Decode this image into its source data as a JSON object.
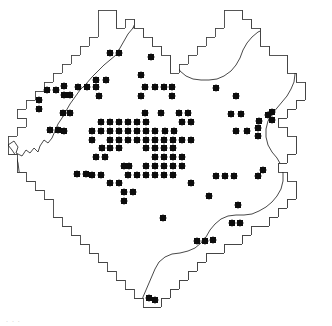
{
  "figure": {
    "kind": "distribution-map",
    "title": "",
    "caption": "",
    "faint_caption_artifact": ". . .",
    "width_px": 332,
    "height_px": 326
  },
  "colors": {
    "background": "#ffffff",
    "region_fill": "#ffffff",
    "region_outline": "#444444",
    "grid_minor": "#3a3a3a",
    "grid_major": "#111111",
    "river": "#1a1a1a",
    "dot": "#0d0d0d"
  },
  "grid": {
    "cell_px": 9,
    "minor_line_width": 0.65,
    "major_line_width": 1.7,
    "major_every_cells": 5,
    "origin_x": 8,
    "origin_y": 1,
    "cols": 36,
    "rows": 36,
    "major_x": [
      35,
      80,
      125,
      170,
      215,
      260,
      305
    ],
    "major_y": [
      28,
      73,
      118,
      163,
      208,
      253,
      298
    ]
  },
  "chart_data": {
    "type": "scatter",
    "xlabel": "",
    "ylabel": "",
    "symbol": "filled-circle",
    "symbol_radius_px": 3.4,
    "record_count": 122,
    "legend": [],
    "records": [
      [
        110,
        53
      ],
      [
        119,
        53
      ],
      [
        151,
        57
      ],
      [
        141,
        75
      ],
      [
        96,
        80
      ],
      [
        106,
        80
      ],
      [
        64,
        86
      ],
      [
        78,
        87
      ],
      [
        87,
        87
      ],
      [
        96,
        87
      ],
      [
        47,
        90
      ],
      [
        56,
        90
      ],
      [
        145,
        87
      ],
      [
        155,
        87
      ],
      [
        164,
        87
      ],
      [
        172,
        87
      ],
      [
        141,
        96
      ],
      [
        172,
        96
      ],
      [
        39,
        100
      ],
      [
        39,
        109
      ],
      [
        99,
        96
      ],
      [
        64,
        95
      ],
      [
        70,
        95
      ],
      [
        216,
        88
      ],
      [
        236,
        96
      ],
      [
        231,
        114
      ],
      [
        145,
        113
      ],
      [
        161,
        113
      ],
      [
        63,
        113
      ],
      [
        70,
        113
      ],
      [
        179,
        113
      ],
      [
        188,
        113
      ],
      [
        241,
        114
      ],
      [
        268,
        115
      ],
      [
        272,
        112
      ],
      [
        272,
        120
      ],
      [
        259,
        121
      ],
      [
        101,
        122
      ],
      [
        128,
        122
      ],
      [
        137,
        122
      ],
      [
        146,
        122
      ],
      [
        119,
        122
      ],
      [
        110,
        122
      ],
      [
        182,
        122
      ],
      [
        191,
        122
      ],
      [
        50,
        130
      ],
      [
        58,
        130
      ],
      [
        64,
        131
      ],
      [
        92,
        131
      ],
      [
        101,
        131
      ],
      [
        128,
        131
      ],
      [
        137,
        131
      ],
      [
        146,
        131
      ],
      [
        155,
        131
      ],
      [
        119,
        131
      ],
      [
        110,
        131
      ],
      [
        165,
        131
      ],
      [
        174,
        131
      ],
      [
        236,
        131
      ],
      [
        247,
        131
      ],
      [
        258,
        128
      ],
      [
        258,
        136
      ],
      [
        92,
        140
      ],
      [
        128,
        140
      ],
      [
        137,
        140
      ],
      [
        146,
        140
      ],
      [
        155,
        140
      ],
      [
        164,
        140
      ],
      [
        173,
        140
      ],
      [
        182,
        140
      ],
      [
        191,
        140
      ],
      [
        110,
        140
      ],
      [
        119,
        140
      ],
      [
        102,
        148
      ],
      [
        110,
        148
      ],
      [
        119,
        148
      ],
      [
        146,
        148
      ],
      [
        155,
        148
      ],
      [
        164,
        148
      ],
      [
        173,
        148
      ],
      [
        96,
        157
      ],
      [
        105,
        157
      ],
      [
        155,
        157
      ],
      [
        164,
        157
      ],
      [
        173,
        157
      ],
      [
        182,
        157
      ],
      [
        146,
        166
      ],
      [
        155,
        166
      ],
      [
        164,
        166
      ],
      [
        173,
        166
      ],
      [
        182,
        166
      ],
      [
        124,
        166
      ],
      [
        129,
        166
      ],
      [
        77,
        174
      ],
      [
        86,
        174
      ],
      [
        92,
        175
      ],
      [
        101,
        175
      ],
      [
        128,
        175
      ],
      [
        137,
        175
      ],
      [
        146,
        175
      ],
      [
        155,
        175
      ],
      [
        164,
        175
      ],
      [
        173,
        175
      ],
      [
        216,
        176
      ],
      [
        225,
        176
      ],
      [
        234,
        176
      ],
      [
        191,
        183
      ],
      [
        110,
        183
      ],
      [
        119,
        183
      ],
      [
        124,
        192
      ],
      [
        133,
        192
      ],
      [
        209,
        196
      ],
      [
        258,
        176
      ],
      [
        263,
        170
      ],
      [
        238,
        205
      ],
      [
        124,
        201
      ],
      [
        163,
        218
      ],
      [
        232,
        223
      ],
      [
        240,
        223
      ],
      [
        197,
        241
      ],
      [
        205,
        241
      ],
      [
        213,
        240
      ],
      [
        149,
        298
      ],
      [
        155,
        300
      ]
    ]
  },
  "region": {
    "name": "",
    "outline_path": "M 98,19 L 98,10 L 116,10 L 116,28 L 125,28 L 125,19 L 134,19 L 134,28 L 143,28 L 143,37 L 152,37 L 152,46 L 161,46 L 161,55 L 170,55 L 170,73 L 179,73 L 179,64 L 188,64 L 188,55 L 197,55 L 197,46 L 206,46 L 206,37 L 215,37 L 215,28 L 224,28 L 224,10 L 242,10 L 242,19 L 251,19 L 251,28 L 260,28 L 260,46 L 269,46 L 269,55 L 287,55 L 287,73 L 296,73 L 296,82 L 305,82 L 305,100 L 296,100 L 296,109 L 287,109 L 287,118 L 278,118 L 278,127 L 287,127 L 287,136 L 296,136 L 296,154 L 287,154 L 287,163 L 278,163 L 278,172 L 287,172 L 287,181 L 296,181 L 296,199 L 287,199 L 287,208 L 278,208 L 278,217 L 269,217 L 269,226 L 251,226 L 251,235 L 242,235 L 242,244 L 224,244 L 224,253 L 206,253 L 206,262 L 197,262 L 197,271 L 188,271 L 188,280 L 179,280 L 179,289 L 170,289 L 170,298 L 161,298 L 161,307 L 143,307 L 143,298 L 134,298 L 134,289 L 125,289 L 125,280 L 116,280 L 116,271 L 107,271 L 107,262 L 98,262 L 98,253 L 89,253 L 89,244 L 80,244 L 80,235 L 71,235 L 71,226 L 62,226 L 62,217 L 53,217 L 53,199 L 44,199 L 44,190 L 35,190 L 35,181 L 26,181 L 26,172 L 17,172 L 17,154 L 8,154 L 8,136 L 17,136 L 17,127 L 26,127 L 26,118 L 17,118 L 17,109 L 26,109 L 26,100 L 35,100 L 35,91 L 44,91 L 44,82 L 53,82 L 53,73 L 62,73 L 62,64 L 71,64 L 71,55 L 80,55 L 80,46 L 89,46 L 89,37 L 98,37 Z",
    "river_paths": [
      "M 8,145 L 14,141 L 18,147 L 16,153 L 22,156 L 26,150 L 30,153 L 34,148 L 38,152 L 40,146 L 44,140 L 48,143 L 52,138 L 55,131 L 58,124 L 62,118 L 66,111 L 70,104 L 75,97 L 80,90 L 86,84 L 92,77 L 98,71 L 104,65 L 110,60 L 116,55 L 120,48 L 124,41 L 128,34 L 133,28 L 140,24 L 148,22 L 156,23 L 163,27 L 168,33 L 171,40 L 173,48 L 174,56 L 176,64 L 180,71 L 186,76 L 193,79 L 201,80 L 209,80 L 217,79 L 224,76 L 231,71 L 236,65 L 240,58 L 243,50 L 247,43 L 252,37 L 258,32 L 265,29 L 272,28 L 279,30 L 285,35 L 289,42 L 292,50 L 294,58 L 295,66 L 295,74 L 294,82 L 291,89 L 287,96 L 282,102 L 277,108 L 272,114 L 268,121 L 266,129 L 266,137 L 268,145 L 272,152 L 277,158 L 281,165 L 283,173 L 283,181 L 281,189 L 277,196 L 272,202 L 266,207 L 259,211 L 252,214 L 244,215 L 236,215 L 228,216 L 221,219 L 215,224 L 210,230 L 206,237 L 201,243 L 195,248 L 188,251 L 180,253 L 172,254 L 165,257 L 159,262 L 155,269 L 152,276 L 149,283 L 146,290 L 143,297 L 141,305",
      "M 133,28 L 136,21 L 140,15 L 146,11 L 153,10 L 160,12 L 165,17 L 168,24 L 168,31",
      "M 8,145 L 12,150 L 16,156 L 18,163 L 19,171 L 21,179"
    ]
  },
  "annotations": {
    "note": "Filled circles denote presence records in grid squares"
  }
}
